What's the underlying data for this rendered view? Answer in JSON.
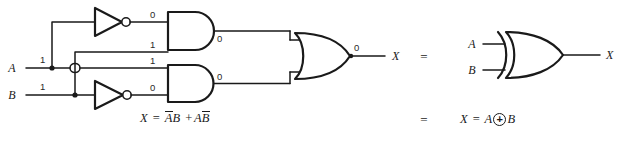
{
  "diagram": {
    "stroke_color": "#1a1a1a",
    "background": "#ffffff",
    "inputs": [
      {
        "name": "A",
        "label": "A",
        "value": "1"
      },
      {
        "name": "B",
        "label": "B",
        "value": "1"
      }
    ],
    "outputs": [
      {
        "name": "X-left",
        "label": "X",
        "value": "0"
      },
      {
        "name": "X-right",
        "label": "X"
      }
    ],
    "gates": [
      {
        "id": "inv-a",
        "type": "inverter",
        "input_signal": "A",
        "output_value": "0"
      },
      {
        "id": "inv-b",
        "type": "inverter",
        "input_signal": "B",
        "output_value": "0"
      },
      {
        "id": "and-top",
        "type": "and",
        "input_values": [
          "0",
          "1"
        ],
        "output_value": "0"
      },
      {
        "id": "and-bottom",
        "type": "and",
        "input_values": [
          "1",
          "0"
        ],
        "output_value": "0"
      },
      {
        "id": "or",
        "type": "or",
        "output_value": "0"
      },
      {
        "id": "xor",
        "type": "xor",
        "inputs": [
          "A",
          "B"
        ]
      }
    ],
    "signal_values": {
      "inv_a_out": "0",
      "and_top_in2": "1",
      "and_top_out": "0",
      "and_bottom_in1": "1",
      "inv_b_out": "0",
      "and_bottom_out": "0",
      "or_out": "0"
    },
    "equality_signs": [
      "=",
      "="
    ]
  },
  "formulas": {
    "sop": {
      "lhs": "X",
      "eq": "=",
      "term1_a": "A",
      "term1_b": "B",
      "plus": "+",
      "term2_a": "A",
      "term2_b": "B"
    },
    "xor": {
      "lhs": "X",
      "eq": "=",
      "a": "A",
      "op_name": "xor-circled-plus",
      "b": "B"
    }
  }
}
